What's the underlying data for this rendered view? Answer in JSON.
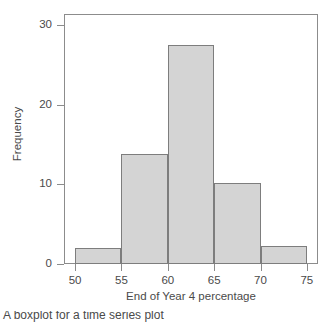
{
  "chart_data": {
    "type": "bar",
    "title": "",
    "subtitle": "",
    "xlabel": "End of Year 4 percentage",
    "ylabel": "Frequency",
    "categories": [
      "50-55",
      "55-60",
      "60-65",
      "65-70",
      "70-75"
    ],
    "values": [
      2,
      13.8,
      27.5,
      10.2,
      2.2
    ],
    "bin_edges": [
      50,
      55,
      60,
      65,
      70,
      75
    ],
    "bin_width": 5,
    "xlim": [
      48.8,
      76.2
    ],
    "ylim": [
      0,
      31.4
    ],
    "xticks": [
      50,
      55,
      60,
      65,
      70,
      75
    ],
    "yticks": [
      0,
      10,
      20,
      30
    ],
    "xtick_labels": [
      "50",
      "55",
      "60",
      "65",
      "70",
      "75"
    ],
    "ytick_labels": [
      "0",
      "10",
      "20",
      "30"
    ],
    "grid": false,
    "legend": false,
    "legend_position": "none",
    "bar_fill_color": "#d4d4d4",
    "bar_edge_color": "#7d7d7d",
    "frame_color": "#8c8c8c",
    "background_color": "#ffffff",
    "text_color": "#4a4a4a"
  },
  "caption": {
    "text": "A boxplot for a time series plot"
  }
}
